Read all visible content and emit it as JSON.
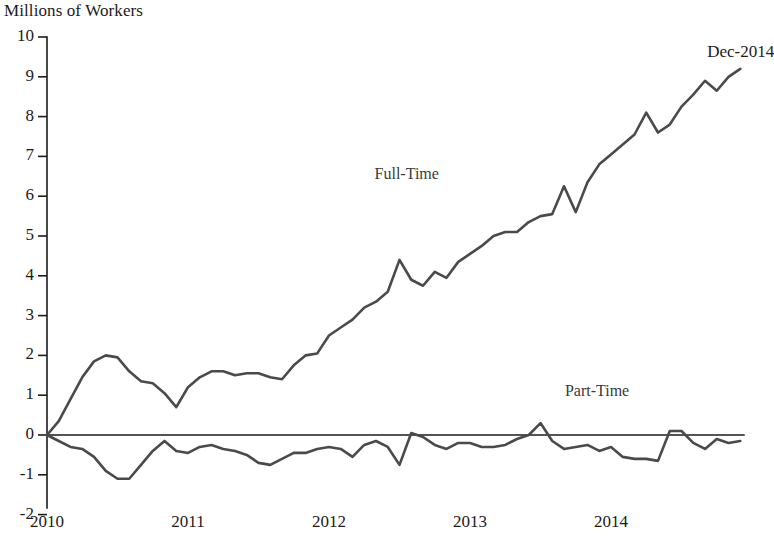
{
  "chart_data": {
    "type": "line",
    "title": "Millions of Workers",
    "ylabel": "Millions of Workers",
    "xlabel": "",
    "ylim": [
      -2,
      10
    ],
    "yticks": [
      -2,
      -1,
      0,
      1,
      2,
      3,
      4,
      5,
      6,
      7,
      8,
      9,
      10
    ],
    "ytick_labels": [
      "-2",
      "-1",
      "0",
      "1",
      "2",
      "3",
      "4",
      "5",
      "6",
      "7",
      "8",
      "9",
      "10"
    ],
    "xlim": [
      2010,
      2015
    ],
    "xticks": [
      2010,
      2011,
      2012,
      2013,
      2014
    ],
    "xtick_labels": [
      "2010",
      "2011",
      "2012",
      "2013",
      "2014"
    ],
    "grid": false,
    "legend_position": "inline-annotation",
    "annotations": [
      {
        "text": "Dec-2014",
        "x": 2014.92,
        "y": 9.6
      },
      {
        "text": "Full-Time",
        "x": 2012.55,
        "y": 6.5
      },
      {
        "text": "Part-Time",
        "x": 2013.9,
        "y": 1.05
      }
    ],
    "x": [
      2010.0,
      2010.0833,
      2010.1667,
      2010.25,
      2010.3333,
      2010.4167,
      2010.5,
      2010.5833,
      2010.6667,
      2010.75,
      2010.8333,
      2010.9167,
      2011.0,
      2011.0833,
      2011.1667,
      2011.25,
      2011.3333,
      2011.4167,
      2011.5,
      2011.5833,
      2011.6667,
      2011.75,
      2011.8333,
      2011.9167,
      2012.0,
      2012.0833,
      2012.1667,
      2012.25,
      2012.3333,
      2012.4167,
      2012.5,
      2012.5833,
      2012.6667,
      2012.75,
      2012.8333,
      2012.9167,
      2013.0,
      2013.0833,
      2013.1667,
      2013.25,
      2013.3333,
      2013.4167,
      2013.5,
      2013.5833,
      2013.6667,
      2013.75,
      2013.8333,
      2013.9167,
      2014.0,
      2014.0833,
      2014.1667,
      2014.25,
      2014.3333,
      2014.4167,
      2014.5,
      2014.5833,
      2014.6667,
      2014.75,
      2014.8333,
      2014.9167
    ],
    "series": [
      {
        "name": "Full-Time",
        "values": [
          0.0,
          0.35,
          0.9,
          1.45,
          1.85,
          2.0,
          1.95,
          1.6,
          1.35,
          1.3,
          1.05,
          0.7,
          1.2,
          1.45,
          1.6,
          1.6,
          1.5,
          1.55,
          1.55,
          1.45,
          1.4,
          1.75,
          2.0,
          2.05,
          2.5,
          2.7,
          2.9,
          3.2,
          3.35,
          3.6,
          4.4,
          3.9,
          3.75,
          4.1,
          3.95,
          4.35,
          4.55,
          4.75,
          5.0,
          5.1,
          5.1,
          5.35,
          5.5,
          5.55,
          6.25,
          5.6,
          6.35,
          6.8,
          7.05,
          7.3,
          7.55,
          8.1,
          7.6,
          7.8,
          8.25,
          8.55,
          8.9,
          8.65,
          9.0,
          9.2
        ]
      },
      {
        "name": "Part-Time",
        "values": [
          0.0,
          -0.15,
          -0.3,
          -0.35,
          -0.55,
          -0.9,
          -1.1,
          -1.1,
          -0.75,
          -0.4,
          -0.15,
          -0.4,
          -0.45,
          -0.3,
          -0.25,
          -0.35,
          -0.4,
          -0.5,
          -0.7,
          -0.75,
          -0.6,
          -0.45,
          -0.45,
          -0.35,
          -0.3,
          -0.35,
          -0.55,
          -0.25,
          -0.15,
          -0.3,
          -0.75,
          0.05,
          -0.05,
          -0.25,
          -0.35,
          -0.2,
          -0.2,
          -0.3,
          -0.3,
          -0.25,
          -0.1,
          0.0,
          0.3,
          -0.15,
          -0.35,
          -0.3,
          -0.25,
          -0.4,
          -0.3,
          -0.55,
          -0.6,
          -0.6,
          -0.65,
          0.1,
          0.1,
          -0.2,
          -0.35,
          -0.1,
          -0.2,
          -0.15
        ]
      }
    ]
  },
  "axis": {
    "y_title": "Millions of Workers"
  }
}
